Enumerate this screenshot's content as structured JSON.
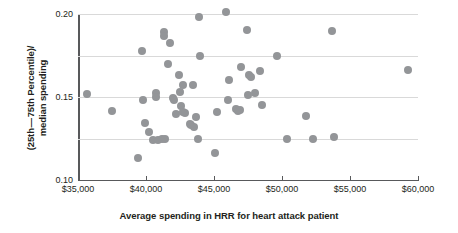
{
  "chart_data": {
    "type": "scatter",
    "title": "",
    "xlabel": "Average spending in HRR for heart attack patient",
    "ylabel_line1": "(25th — 75th Percentile)/",
    "ylabel_line2": "median spending",
    "xlim": [
      35000,
      60000
    ],
    "ylim": [
      0.0,
      0.2
    ],
    "xticks": [
      35000,
      40000,
      45000,
      50000,
      55000,
      60000
    ],
    "xtick_labels": [
      "$35,000",
      "$40,000",
      "$45,000",
      "$50,000",
      "$55,000",
      "$60,000"
    ],
    "yticks": [
      0.05,
      0.1,
      0.15,
      0.2
    ],
    "ytick_labels": [
      "0.05",
      "0.10",
      "0.15",
      "0.20"
    ],
    "grid": "horizontal",
    "legend": "none",
    "marker_color": "#939598",
    "marker_size": 8,
    "points": [
      {
        "x": 35650,
        "y": 0.104
      },
      {
        "x": 37500,
        "y": 0.083
      },
      {
        "x": 39400,
        "y": 0.027
      },
      {
        "x": 39700,
        "y": 0.155
      },
      {
        "x": 39800,
        "y": 0.096
      },
      {
        "x": 39900,
        "y": 0.069
      },
      {
        "x": 40200,
        "y": 0.058
      },
      {
        "x": 40500,
        "y": 0.048
      },
      {
        "x": 40700,
        "y": 0.105
      },
      {
        "x": 40750,
        "y": 0.1
      },
      {
        "x": 40900,
        "y": 0.048
      },
      {
        "x": 41200,
        "y": 0.05
      },
      {
        "x": 41300,
        "y": 0.178
      },
      {
        "x": 41350,
        "y": 0.174
      },
      {
        "x": 41400,
        "y": 0.049
      },
      {
        "x": 41600,
        "y": 0.14
      },
      {
        "x": 41750,
        "y": 0.165
      },
      {
        "x": 42000,
        "y": 0.099
      },
      {
        "x": 42050,
        "y": 0.096
      },
      {
        "x": 42200,
        "y": 0.08
      },
      {
        "x": 42400,
        "y": 0.127
      },
      {
        "x": 42500,
        "y": 0.106
      },
      {
        "x": 42600,
        "y": 0.089
      },
      {
        "x": 42700,
        "y": 0.115
      },
      {
        "x": 42750,
        "y": 0.082
      },
      {
        "x": 42900,
        "y": 0.081
      },
      {
        "x": 43200,
        "y": 0.068
      },
      {
        "x": 43300,
        "y": 0.066
      },
      {
        "x": 43450,
        "y": 0.114
      },
      {
        "x": 43500,
        "y": 0.064
      },
      {
        "x": 43700,
        "y": 0.076
      },
      {
        "x": 43850,
        "y": 0.049
      },
      {
        "x": 43900,
        "y": 0.196
      },
      {
        "x": 44000,
        "y": 0.149
      },
      {
        "x": 45100,
        "y": 0.033
      },
      {
        "x": 45200,
        "y": 0.082
      },
      {
        "x": 45900,
        "y": 0.203
      },
      {
        "x": 46000,
        "y": 0.096
      },
      {
        "x": 46100,
        "y": 0.121
      },
      {
        "x": 46600,
        "y": 0.085
      },
      {
        "x": 46800,
        "y": 0.083
      },
      {
        "x": 46900,
        "y": 0.084
      },
      {
        "x": 47000,
        "y": 0.136
      },
      {
        "x": 47400,
        "y": 0.181
      },
      {
        "x": 47500,
        "y": 0.103
      },
      {
        "x": 47600,
        "y": 0.126
      },
      {
        "x": 47700,
        "y": 0.124
      },
      {
        "x": 48000,
        "y": 0.105
      },
      {
        "x": 48400,
        "y": 0.131
      },
      {
        "x": 48500,
        "y": 0.09
      },
      {
        "x": 49600,
        "y": 0.15
      },
      {
        "x": 50400,
        "y": 0.049
      },
      {
        "x": 51800,
        "y": 0.077
      },
      {
        "x": 52300,
        "y": 0.05
      },
      {
        "x": 53700,
        "y": 0.18
      },
      {
        "x": 53800,
        "y": 0.052
      },
      {
        "x": 59300,
        "y": 0.133
      }
    ]
  }
}
